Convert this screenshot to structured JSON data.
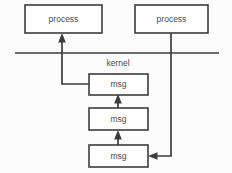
{
  "diagram": {
    "divider_label": "kernel",
    "colors": {
      "background": "#fcfcfc",
      "box_fill": "#ffffff",
      "stroke": "#3c3c3c",
      "text": "#4a4a4a"
    },
    "nodes": [
      {
        "id": "process-left",
        "label": "process",
        "x": 25,
        "y": 5,
        "w": 77,
        "h": 28
      },
      {
        "id": "process-right",
        "label": "process",
        "x": 135,
        "y": 5,
        "w": 73,
        "h": 28
      },
      {
        "id": "msg-top",
        "label": "msg",
        "x": 89,
        "y": 74,
        "w": 59,
        "h": 21
      },
      {
        "id": "msg-middle",
        "label": "msg",
        "x": 89,
        "y": 108,
        "w": 59,
        "h": 22
      },
      {
        "id": "msg-bottom",
        "label": "msg",
        "x": 89,
        "y": 145,
        "w": 59,
        "h": 22
      }
    ],
    "divider": {
      "x1": 15,
      "y1": 53,
      "x2": 219,
      "y2": 53
    },
    "divider_label_pos": {
      "x": 118,
      "y": 64
    },
    "edges": [
      {
        "id": "edge-msgtop-to-processleft",
        "from": "msg-top",
        "to": "process-left",
        "arrow": "up"
      },
      {
        "id": "edge-msgmiddle-to-msgtop",
        "from": "msg-middle",
        "to": "msg-top",
        "arrow": "up"
      },
      {
        "id": "edge-msgbottom-to-msgmiddle",
        "from": "msg-bottom",
        "to": "msg-middle",
        "arrow": "up"
      },
      {
        "id": "edge-processright-to-msgbottom",
        "from": "process-right",
        "to": "msg-bottom",
        "arrow": "left"
      }
    ]
  }
}
